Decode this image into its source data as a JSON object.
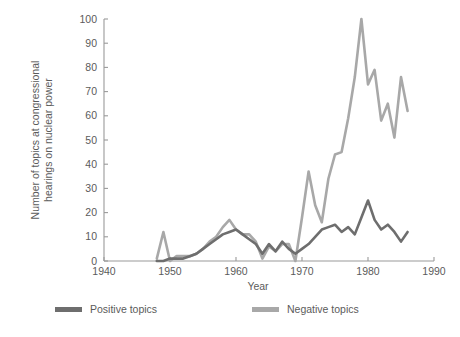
{
  "chart_data": {
    "type": "line",
    "title": "",
    "subtitle": "",
    "xlabel": "Year",
    "ylabel": "Number of topics at congressional hearings on nuclear power",
    "ylabel_line1": "Number of topics at congressional",
    "ylabel_line2": "hearings on nuclear power",
    "xlim": [
      1940,
      1990
    ],
    "ylim": [
      0,
      100
    ],
    "xticks": [
      1940,
      1950,
      1960,
      1970,
      1980,
      1990
    ],
    "yticks": [
      0,
      10,
      20,
      30,
      40,
      50,
      60,
      70,
      80,
      90,
      100
    ],
    "xtick_labels": [
      "1940",
      "1950",
      "1960",
      "1970",
      "1980",
      "1990"
    ],
    "ytick_labels": [
      "0",
      "10",
      "20",
      "30",
      "40",
      "50",
      "60",
      "70",
      "80",
      "90",
      "100"
    ],
    "grid": false,
    "legend_position": "bottom",
    "colors": {
      "positive": "#6e6e6e",
      "negative": "#a8a8a8",
      "axis": "#9a9a9a",
      "text": "#5b5b5b",
      "background": "#ffffff"
    },
    "x": [
      1948,
      1949,
      1950,
      1951,
      1952,
      1953,
      1954,
      1955,
      1956,
      1957,
      1958,
      1959,
      1960,
      1961,
      1962,
      1963,
      1964,
      1965,
      1966,
      1967,
      1968,
      1969,
      1970,
      1971,
      1972,
      1973,
      1974,
      1975,
      1976,
      1977,
      1978,
      1979,
      1980,
      1981,
      1982,
      1983,
      1984,
      1985,
      1986
    ],
    "series": [
      {
        "name": "Positive topics",
        "color": "#6e6e6e",
        "values": [
          0,
          0,
          1,
          1,
          1,
          2,
          3,
          5,
          7,
          9,
          11,
          12,
          13,
          11,
          9,
          7,
          3,
          7,
          4,
          8,
          5,
          3,
          5,
          7,
          10,
          13,
          14,
          15,
          12,
          14,
          11,
          18,
          25,
          17,
          13,
          15,
          12,
          8,
          12
        ]
      },
      {
        "name": "Negative topics",
        "color": "#a8a8a8",
        "values": [
          1,
          12,
          0,
          2,
          2,
          2,
          3,
          5,
          8,
          10,
          14,
          17,
          13,
          11,
          11,
          8,
          1,
          6,
          4,
          7,
          7,
          0,
          18,
          37,
          23,
          16,
          34,
          44,
          45,
          59,
          76,
          100,
          73,
          79,
          58,
          65,
          51,
          76,
          62
        ]
      }
    ],
    "legend": [
      {
        "label": "Positive topics",
        "color": "#6e6e6e",
        "key": "positive"
      },
      {
        "label": "Negative topics",
        "color": "#a8a8a8",
        "key": "negative"
      }
    ]
  }
}
